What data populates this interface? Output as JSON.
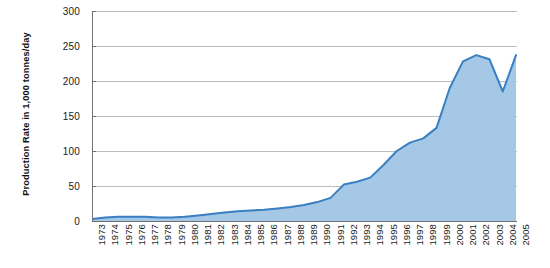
{
  "chart_data": {
    "type": "area",
    "title": "",
    "subtitle": "",
    "xlabel": "",
    "ylabel": "Production Rate in 1,000 tonnes/day",
    "ylim": [
      0,
      300
    ],
    "yticks": [
      0,
      50,
      100,
      150,
      200,
      250,
      300
    ],
    "ytick_labels": [
      "0",
      "50",
      "100",
      "150",
      "200",
      "250",
      "300"
    ],
    "grid": true,
    "legend": false,
    "legend_position": "none",
    "categories": [
      "1973",
      "1974",
      "1975",
      "1976",
      "1977",
      "1978",
      "1979",
      "1980",
      "1981",
      "1982",
      "1983",
      "1984",
      "1985",
      "1986",
      "1987",
      "1988",
      "1989",
      "1990",
      "1991",
      "1992",
      "1993",
      "1994",
      "1995",
      "1996",
      "1997",
      "1998",
      "1999",
      "2000",
      "2001",
      "2002",
      "2003",
      "2004",
      "2005"
    ],
    "series": [
      {
        "name": "Production Rate",
        "color": "#3a7fc1",
        "fill_color": "#a5c8e6",
        "values": [
          3,
          5,
          6,
          6,
          6,
          5,
          5,
          6,
          8,
          10,
          12,
          14,
          15,
          16,
          18,
          20,
          23,
          27,
          33,
          52,
          56,
          62,
          80,
          100,
          112,
          118,
          133,
          190,
          228,
          237,
          231,
          185,
          237
        ]
      }
    ],
    "values": [
      3,
      5,
      6,
      6,
      6,
      5,
      5,
      6,
      8,
      10,
      12,
      14,
      15,
      16,
      18,
      20,
      23,
      27,
      33,
      52,
      56,
      62,
      80,
      100,
      112,
      118,
      133,
      190,
      228,
      237,
      231,
      185,
      237
    ],
    "colors": {
      "line": "#3a7fc1",
      "fill": "#a5c8e6",
      "grid": "#b9bcc0",
      "axis": "#6e7276",
      "text": "#1a1a1a",
      "background": "#ffffff"
    }
  }
}
